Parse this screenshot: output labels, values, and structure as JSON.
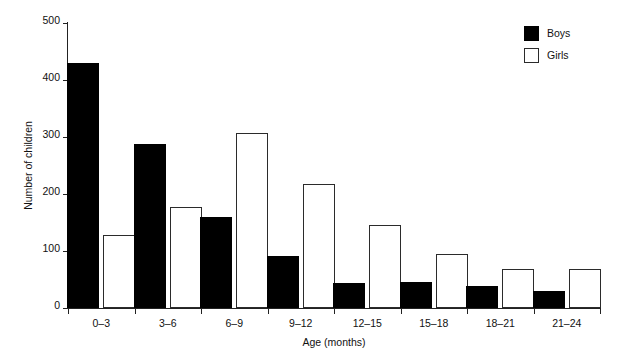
{
  "chart_data": {
    "type": "bar",
    "title": "",
    "xlabel": "Age (months)",
    "ylabel": "Number of children",
    "categories": [
      "0–3",
      "3–6",
      "6–9",
      "9–12",
      "12–15",
      "15–18",
      "18–21",
      "21–24"
    ],
    "series": [
      {
        "name": "Boys",
        "color": "#000000",
        "values": [
          430,
          288,
          160,
          92,
          44,
          45,
          38,
          30
        ]
      },
      {
        "name": "Girls",
        "color": "#ffffff",
        "values": [
          128,
          177,
          307,
          218,
          145,
          95,
          68,
          68
        ]
      }
    ],
    "ylim": [
      0,
      500
    ],
    "yticks": [
      0,
      100,
      200,
      300,
      400,
      500
    ],
    "ytick_labels": [
      "0",
      "100",
      "200",
      "300",
      "400",
      "500"
    ],
    "grid": false,
    "legend_position": "top-right"
  },
  "legend": {
    "entries": [
      {
        "label": "Boys",
        "style": "filled-black"
      },
      {
        "label": "Girls",
        "style": "outlined-white"
      }
    ]
  }
}
